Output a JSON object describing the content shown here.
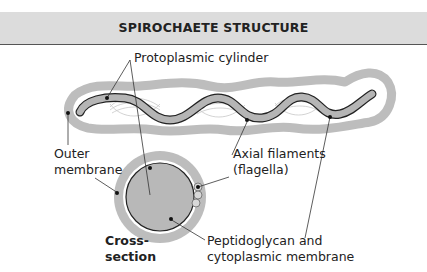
{
  "header": {
    "title": "SPIROCHAETE STRUCTURE"
  },
  "labels": {
    "protoplasmic_cylinder": "Protoplasmic cylinder",
    "outer_membrane_1": "Outer",
    "outer_membrane_2": "membrane",
    "axial_filaments_1": "Axial filaments",
    "axial_filaments_2": "(flagella)",
    "cross_section_1": "Cross-",
    "cross_section_2": "section",
    "peptidoglycan_1": "Peptidoglycan and",
    "peptidoglycan_2": "cytoplasmic membrane"
  },
  "colors": {
    "header_bg": "#dcdcdc",
    "membrane_grey": "#bdbdbd",
    "cylinder_grey": "#b5b5b5",
    "outline": "#222222"
  }
}
